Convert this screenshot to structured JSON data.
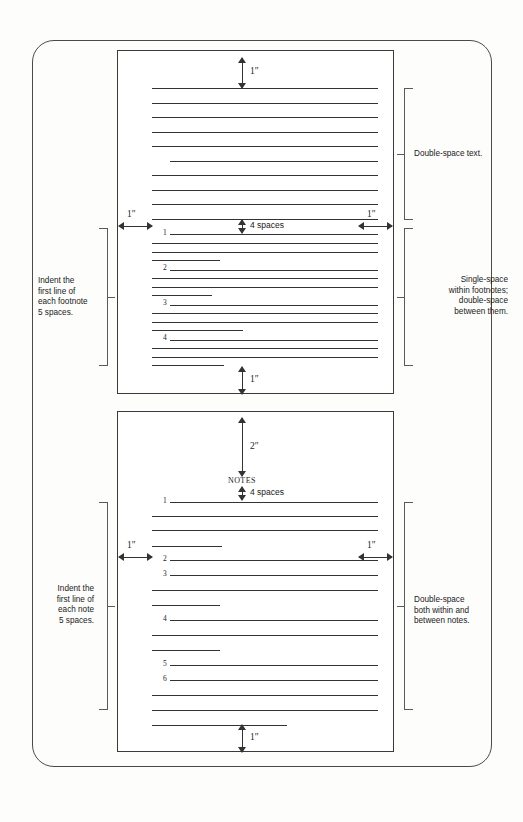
{
  "figure": {
    "type": "instructional-diagram"
  },
  "page_one": {
    "name": "Footnote page",
    "dimensions": {
      "top_margin": "1″",
      "bottom_margin": "1″",
      "left_margin": "1″",
      "right_margin": "1″",
      "footnote_gap": "4 spaces"
    },
    "annotations": {
      "right_top": "Double-space text.",
      "right_bottom": "Single-space\nwithin footnotes;\ndouble-space\nbetween them.",
      "left": "Indent the\nfirst line of\neach footnote\n5 spaces."
    },
    "footnote_numbers": [
      "1",
      "2",
      "3",
      "4"
    ],
    "body_line_count": 10,
    "indented_body_line_index": 6
  },
  "page_two": {
    "name": "Endnotes page",
    "heading": "NOTES",
    "dimensions": {
      "top_to_heading": "2″",
      "heading_gap": "4 spaces",
      "bottom_margin": "1″",
      "left_margin": "1″",
      "right_margin": "1″"
    },
    "annotations": {
      "right": "Double-space\nboth within and\nbetween notes.",
      "left": "Indent the\nfirst line of\neach note\n5 spaces."
    },
    "note_numbers": [
      "1",
      "2",
      "3",
      "4",
      "5",
      "6"
    ]
  },
  "colors": {
    "ink": "#1a1a1a",
    "rule": "#333333",
    "frame": "#4a4a4a",
    "bracket": "#5a5a5a",
    "paper": "#fdfdfc"
  }
}
